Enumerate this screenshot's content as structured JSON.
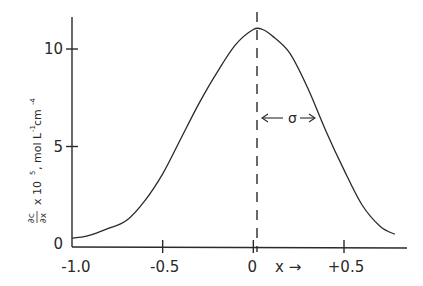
{
  "chart_data": {
    "type": "line",
    "title": "",
    "xlabel": "x →",
    "ylabel": "∂c/∂x × 10⁵, mol L⁻¹ cm⁻⁴",
    "ylabel_parts": {
      "fraction_num": "∂c",
      "fraction_den": "∂x",
      "rest": "x 10",
      "exp": "5",
      "units": ", mol L",
      "units_exp1": "-1",
      "units_cm": " cm",
      "units_exp2": "-4"
    },
    "xlim": [
      -1.0,
      0.8
    ],
    "ylim": [
      0,
      12
    ],
    "grid": false,
    "legend": null,
    "x_ticks": [
      {
        "value": -1.0,
        "label": "-1.0"
      },
      {
        "value": -0.5,
        "label": "-0.5"
      },
      {
        "value": 0,
        "label": "0"
      },
      {
        "value": 0.5,
        "label": "+0.5"
      }
    ],
    "y_ticks": [
      {
        "value": 0,
        "label": "0"
      },
      {
        "value": 5,
        "label": "5"
      },
      {
        "value": 10,
        "label": "10"
      }
    ],
    "series": [
      {
        "name": "concentration gradient",
        "x": [
          -1.0,
          -0.95,
          -0.9,
          -0.8,
          -0.7,
          -0.6,
          -0.5,
          -0.4,
          -0.3,
          -0.2,
          -0.1,
          0.0,
          0.05,
          0.1,
          0.2,
          0.3,
          0.4,
          0.5,
          0.6,
          0.7,
          0.78
        ],
        "values": [
          0.3,
          0.35,
          0.45,
          0.8,
          1.2,
          2.2,
          3.6,
          5.4,
          7.2,
          8.8,
          10.2,
          11.0,
          11.0,
          10.7,
          9.8,
          8.0,
          5.8,
          3.8,
          2.0,
          0.9,
          0.5
        ]
      }
    ],
    "annotations": [
      {
        "type": "vertical-dashed-line",
        "x": 0.02,
        "label": ""
      },
      {
        "type": "double-arrow",
        "from_x": 0.02,
        "to_x": 0.37,
        "y": 6.8,
        "label": "σ"
      }
    ]
  },
  "labels": {
    "x_axis_label": "x →",
    "sigma": "σ",
    "arrow_left": "←",
    "arrow_right": "→"
  }
}
